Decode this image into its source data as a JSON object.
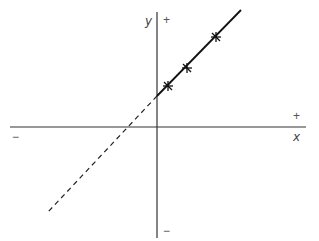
{
  "diagram": {
    "type": "linear-extrapolation-graph",
    "axes": {
      "x": {
        "label": "x",
        "positive_sign": "+",
        "negative_sign": "−"
      },
      "y": {
        "label": "y",
        "positive_sign": "+",
        "negative_sign": "−"
      }
    },
    "colors": {
      "line": "#111111",
      "axis": "#333333",
      "text": "#555555"
    },
    "solid_line": {
      "from": [
        157,
        96
      ],
      "to": [
        241,
        10
      ]
    },
    "dashed_line": {
      "from": [
        157,
        96
      ],
      "to": [
        48,
        212
      ]
    },
    "markers": [
      {
        "x": 168,
        "y": 86
      },
      {
        "x": 187,
        "y": 68
      },
      {
        "x": 216,
        "y": 37
      }
    ]
  }
}
